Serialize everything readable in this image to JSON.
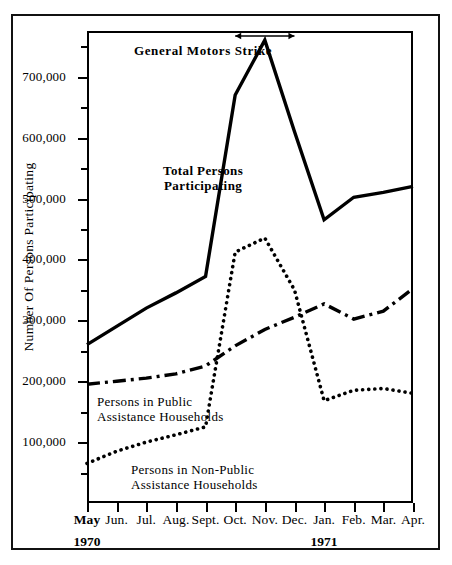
{
  "chart_data": {
    "type": "line",
    "title": "",
    "xlabel": "",
    "ylabel": "Number Of Persons Participating",
    "ylim": [
      0,
      775000
    ],
    "grid": false,
    "legend_position": "inline-annotations",
    "categories": [
      "May",
      "Jun.",
      "Jul.",
      "Aug.",
      "Sept.",
      "Oct.",
      "Nov.",
      "Dec.",
      "Jan.",
      "Feb.",
      "Mar.",
      "Apr."
    ],
    "year_groups": [
      {
        "label": "1970",
        "at_category": "May"
      },
      {
        "label": "1971",
        "at_category": "Jan."
      }
    ],
    "ytick_values": [
      100000,
      200000,
      300000,
      400000,
      500000,
      600000,
      700000
    ],
    "ytick_labels": [
      "100,000",
      "200,000",
      "300,000",
      "400,000",
      "500,000",
      "600,000",
      "700,000"
    ],
    "yminor_values": [
      50000,
      150000,
      250000,
      350000,
      450000,
      550000,
      650000,
      750000
    ],
    "series": [
      {
        "name": "Total Persons Participating",
        "style": "solid",
        "values": [
          260000,
          290000,
          320000,
          345000,
          372000,
          670000,
          760000,
          610000,
          465000,
          502000,
          510000,
          520000
        ]
      },
      {
        "name": "Persons in Public Assistance Households",
        "style": "dash-dot",
        "values": [
          195000,
          200000,
          205000,
          212000,
          225000,
          258000,
          285000,
          305000,
          327000,
          302000,
          315000,
          352000
        ]
      },
      {
        "name": "Persons in Non-Public Assistance Households",
        "style": "dotted",
        "values": [
          65000,
          85000,
          100000,
          112000,
          125000,
          412000,
          435000,
          350000,
          168000,
          185000,
          188000,
          180000
        ]
      }
    ],
    "annotations": [
      {
        "id": "strike",
        "text": "General Motors Strike",
        "type": "span-arrow",
        "from_category": "Oct.",
        "to_category": "Dec."
      },
      {
        "id": "total-label",
        "text_lines": [
          "Total Persons",
          "Participating"
        ]
      },
      {
        "id": "public-label",
        "text_lines": [
          "Persons in Public",
          "Assistance Households"
        ]
      },
      {
        "id": "nonpublic-label",
        "text_lines": [
          "Persons in Non-Public",
          "Assistance Households"
        ]
      }
    ]
  },
  "axes": {
    "y_title": "Number Of Persons Participating"
  },
  "annotations": {
    "strike": "General Motors Strike",
    "total_line1": "Total Persons",
    "total_line2": "Participating",
    "public_line1": "Persons in Public",
    "public_line2": "Assistance Households",
    "nonpublic_line1": "Persons in Non-Public",
    "nonpublic_line2": "Assistance Households"
  }
}
